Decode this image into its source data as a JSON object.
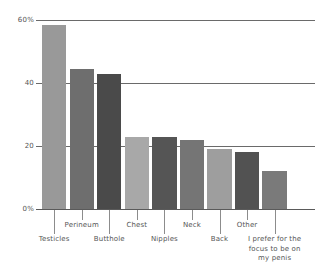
{
  "chart_data": {
    "type": "bar",
    "title": "",
    "subtitle": "",
    "xlabel": "",
    "ylabel": "",
    "ylim": [
      0,
      60
    ],
    "grid": true,
    "legend": false,
    "yticks": [
      {
        "value": 0,
        "label": "0%"
      },
      {
        "value": 20,
        "label": "20"
      },
      {
        "value": 40,
        "label": "40"
      },
      {
        "value": 60,
        "label": "60%"
      }
    ],
    "categories": [
      "Testicles",
      "Perineum",
      "Butthole",
      "Chest",
      "Nipples",
      "Neck",
      "Back",
      "Other",
      "I prefer for the focus to be on my penis"
    ],
    "values": [
      58.4,
      44.5,
      43.0,
      23.0,
      23.0,
      22.0,
      19.0,
      18.0,
      12.0
    ],
    "bar_colors": [
      "#999999",
      "#6e6e6e",
      "#4a4a4a",
      "#a8a8a8",
      "#555555",
      "#757575",
      "#9e9e9e",
      "#525252",
      "#7a7a7a"
    ],
    "label_rows": [
      1,
      0,
      1,
      0,
      1,
      0,
      1,
      0,
      1
    ],
    "axis_color": "#6a6a6a",
    "tick_color": "#8c8c8c",
    "text_color": "#555555",
    "background": "#ffffff"
  }
}
